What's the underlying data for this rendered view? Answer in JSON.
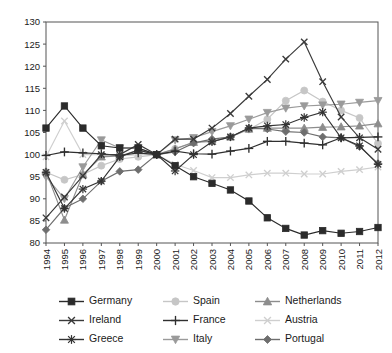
{
  "chart_data": {
    "type": "line",
    "title": "",
    "subtitle": "",
    "xlabel": "",
    "ylabel": "",
    "x": [
      1994,
      1995,
      1996,
      1997,
      1998,
      1999,
      2000,
      2001,
      2002,
      2003,
      2004,
      2005,
      2006,
      2007,
      2008,
      2009,
      2010,
      2011,
      2012
    ],
    "categories": [
      "1994",
      "1995",
      "1996",
      "1997",
      "1998",
      "1999",
      "2000",
      "2001",
      "2002",
      "2003",
      "2004",
      "2005",
      "2006",
      "2007",
      "2008",
      "2009",
      "2010",
      "2011",
      "2012"
    ],
    "xlim": [
      1994,
      2012
    ],
    "ylim": [
      80,
      130
    ],
    "y_ticks": [
      80,
      85,
      90,
      95,
      100,
      105,
      110,
      115,
      120,
      125,
      130
    ],
    "grid": false,
    "legend_position": "bottom",
    "index_base_year": 2000,
    "index_base_value": 100,
    "series": [
      {
        "name": "Germany",
        "color": "#2b2b2b",
        "marker": "square",
        "values": [
          106.0,
          111.0,
          106.0,
          102.0,
          101.5,
          101.5,
          100.0,
          97.5,
          95.0,
          93.5,
          92.0,
          89.5,
          85.7,
          83.3,
          81.8,
          82.8,
          82.2,
          82.6,
          83.5
        ]
      },
      {
        "name": "Ireland",
        "color": "#3a3a3a",
        "marker": "cross-x",
        "values": [
          85.7,
          90.4,
          95.2,
          100.0,
          100.0,
          102.3,
          100.0,
          103.5,
          103.5,
          106.0,
          109.3,
          113.2,
          117.0,
          121.6,
          125.5,
          116.5,
          108.5,
          103.8,
          101.2
        ]
      },
      {
        "name": "Greece",
        "color": "#333333",
        "marker": "asterisk",
        "values": [
          96.0,
          87.8,
          92.2,
          94.0,
          99.5,
          101.0,
          100.0,
          96.3,
          100.0,
          102.9,
          104.0,
          106.0,
          106.5,
          106.8,
          108.4,
          109.6,
          103.8,
          102.0,
          97.8
        ]
      },
      {
        "name": "Spain",
        "color": "#c6c6c6",
        "marker": "circle",
        "values": [
          96.0,
          94.3,
          95.5,
          97.5,
          99.0,
          99.5,
          100.0,
          101.3,
          102.8,
          103.0,
          104.0,
          105.7,
          108.0,
          112.2,
          114.5,
          112.0,
          110.0,
          108.3,
          102.5
        ]
      },
      {
        "name": "France",
        "color": "#2f2f2f",
        "marker": "plus",
        "values": [
          99.8,
          100.6,
          100.4,
          100.2,
          99.8,
          100.4,
          100.0,
          100.8,
          100.2,
          100.1,
          100.8,
          101.4,
          103.0,
          103.0,
          102.6,
          102.2,
          103.8,
          103.9,
          104.0
        ]
      },
      {
        "name": "Italy",
        "color": "#9a9a9a",
        "marker": "triangle-down",
        "values": [
          95.0,
          90.0,
          97.2,
          103.3,
          101.5,
          101.5,
          100.0,
          103.3,
          103.8,
          105.2,
          106.5,
          108.0,
          109.5,
          110.5,
          111.0,
          111.2,
          111.4,
          111.8,
          112.2
        ]
      },
      {
        "name": "Netherlands",
        "color": "#8d8d8d",
        "marker": "triangle-up",
        "values": [
          96.2,
          85.2,
          95.5,
          99.5,
          99.7,
          101.0,
          100.0,
          101.3,
          102.8,
          103.0,
          104.0,
          105.8,
          106.0,
          106.0,
          106.0,
          106.2,
          106.3,
          106.5,
          107.0
        ]
      },
      {
        "name": "Austria",
        "color": "#cfcfcf",
        "marker": "cross-x",
        "values": [
          99.5,
          107.6,
          100.0,
          100.0,
          99.7,
          100.0,
          100.0,
          97.8,
          96.4,
          94.8,
          94.8,
          95.4,
          95.8,
          95.8,
          95.6,
          95.6,
          96.2,
          96.6,
          97.2
        ]
      },
      {
        "name": "Portugal",
        "color": "#6e6e6e",
        "marker": "diamond",
        "values": [
          83.0,
          87.9,
          90.0,
          94.0,
          96.2,
          96.6,
          100.0,
          100.6,
          102.6,
          103.5,
          104.0,
          106.0,
          105.8,
          105.2,
          105.0,
          104.0,
          103.8,
          101.8,
          98.0
        ]
      }
    ]
  },
  "legend": {
    "entries": [
      {
        "label": "Germany"
      },
      {
        "label": "Spain"
      },
      {
        "label": "Netherlands"
      },
      {
        "label": "Ireland"
      },
      {
        "label": "France"
      },
      {
        "label": "Austria"
      },
      {
        "label": "Greece"
      },
      {
        "label": "Italy"
      },
      {
        "label": "Portugal"
      }
    ],
    "order": [
      0,
      3,
      6,
      1,
      4,
      7,
      2,
      5,
      8
    ]
  },
  "axes": {
    "y_tick_labels": [
      "130",
      "125",
      "120",
      "115",
      "110",
      "105",
      "100",
      "95",
      "90",
      "85",
      "80"
    ],
    "x_tick_labels": [
      "1994",
      "1995",
      "1996",
      "1997",
      "1998",
      "1999",
      "2000",
      "2001",
      "2002",
      "2003",
      "2004",
      "2005",
      "2006",
      "2007",
      "2008",
      "2009",
      "2010",
      "2011",
      "2012"
    ]
  },
  "colors": {
    "plot_border": "#555555",
    "background": "#ffffff",
    "text": "#1a1a1a"
  }
}
